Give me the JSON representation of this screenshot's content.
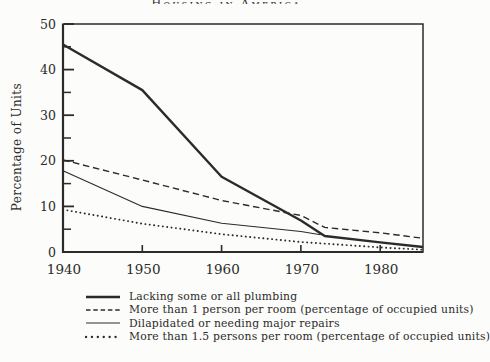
{
  "figure": {
    "cropped_title_fragment": "Housing in America"
  },
  "chart_data": {
    "type": "line",
    "title": "",
    "xlabel": "",
    "ylabel": "Percentage of Units",
    "xlim": [
      1940,
      1985.4
    ],
    "ylim": [
      0,
      50
    ],
    "x_major_ticks": [
      1950,
      1960,
      1970,
      1980
    ],
    "x_tick_labels": [
      "1940",
      "1950",
      "1960",
      "1970",
      "1980"
    ],
    "x_tick_label_years": [
      1940,
      1950,
      1960,
      1970,
      1980
    ],
    "y_major_ticks": [
      0,
      10,
      20,
      30,
      40,
      50
    ],
    "y_minor_ticks": [
      5,
      15,
      25,
      35,
      45
    ],
    "grid": false,
    "frame": "full-box",
    "legend_position": "below-chart-left",
    "ink_color": "#2b2b2b",
    "paper_color": "#fcfcfa",
    "series": [
      {
        "name": "Lacking some or all plumbing",
        "style": "solid-thick",
        "points": [
          [
            1940,
            45.5
          ],
          [
            1950,
            35.5
          ],
          [
            1960,
            16.5
          ],
          [
            1970,
            6.9
          ],
          [
            1973,
            3.5
          ],
          [
            1980,
            2.1
          ],
          [
            1985.4,
            1.1
          ]
        ]
      },
      {
        "name": "More than 1 person per room (percentage of occupied units)",
        "style": "dashed",
        "points": [
          [
            1940,
            20.2
          ],
          [
            1950,
            15.8
          ],
          [
            1960,
            11.3
          ],
          [
            1970,
            8.0
          ],
          [
            1973,
            5.4
          ],
          [
            1980,
            4.2
          ],
          [
            1985.4,
            3.0
          ]
        ]
      },
      {
        "name": "Dilapidated or needing major repairs",
        "style": "solid-thin",
        "points": [
          [
            1940,
            17.8
          ],
          [
            1950,
            10.0
          ],
          [
            1960,
            6.3
          ],
          [
            1970,
            4.5
          ],
          [
            1972.5,
            3.8
          ]
        ]
      },
      {
        "name": "More than 1.5 persons per room (percentage of occupied units)",
        "style": "dotted",
        "points": [
          [
            1940,
            9.3
          ],
          [
            1950,
            6.2
          ],
          [
            1960,
            3.9
          ],
          [
            1970,
            2.2
          ],
          [
            1980,
            1.0
          ],
          [
            1985.4,
            0.5
          ]
        ]
      }
    ]
  }
}
